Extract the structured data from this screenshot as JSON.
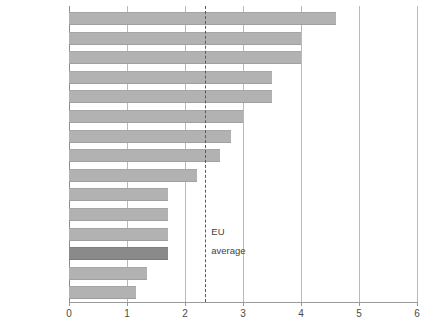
{
  "chart_data": {
    "type": "bar",
    "orientation": "horizontal",
    "title": "",
    "subtitle": "",
    "xlabel": "",
    "ylabel": "",
    "xlim": [
      0,
      6
    ],
    "xticks": [
      0,
      1,
      2,
      3,
      4,
      5,
      6
    ],
    "xtick_labels": [
      "0",
      "1",
      "2",
      "3",
      "4",
      "5",
      "6"
    ],
    "grid": "vertical",
    "legend": "none",
    "categories": [
      "Ireland",
      "Portugal",
      "Spain",
      "Netherlands",
      "Greece",
      "Italy",
      "Luxembourg",
      "Denmark",
      "France",
      "Sweden",
      "Finland",
      "Austria",
      "United Kingdom",
      "Belgium",
      "Germany"
    ],
    "values": [
      4.6,
      4.0,
      4.0,
      3.5,
      3.5,
      3.0,
      2.8,
      2.6,
      2.2,
      1.7,
      1.7,
      1.7,
      1.7,
      1.35,
      1.15
    ],
    "highlight_category": "United Kingdom",
    "annotations": [
      {
        "name": "eu-average",
        "label_line1": "EU",
        "label_line2": "average",
        "value": 2.35,
        "style": "dashed-vertical-line"
      }
    ],
    "colors": {
      "bar": "#b2b2b2",
      "bar_highlight": "#8a8a8a",
      "gridline": "#b9b9b9",
      "axis": "#9a9a9a",
      "reference_line": "#5a5a5a",
      "text": "#3f3f3f",
      "background": "#ffffff"
    }
  }
}
